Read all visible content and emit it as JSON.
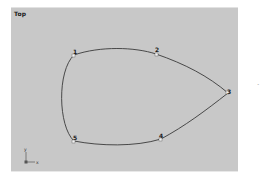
{
  "viewport": {
    "label": "Top",
    "background": "#c8c8c8",
    "curve_color": "#3a3a3a"
  },
  "spline": {
    "closed": true,
    "vertices": [
      {
        "id": "1",
        "x": 63,
        "y": 47
      },
      {
        "id": "2",
        "x": 145,
        "y": 48
      },
      {
        "id": "3",
        "x": 218,
        "y": 83
      },
      {
        "id": "4",
        "x": 150,
        "y": 131
      },
      {
        "id": "5",
        "x": 64,
        "y": 132
      }
    ]
  },
  "axis_gizmo": {
    "y_label": "y",
    "x_label": "x"
  }
}
